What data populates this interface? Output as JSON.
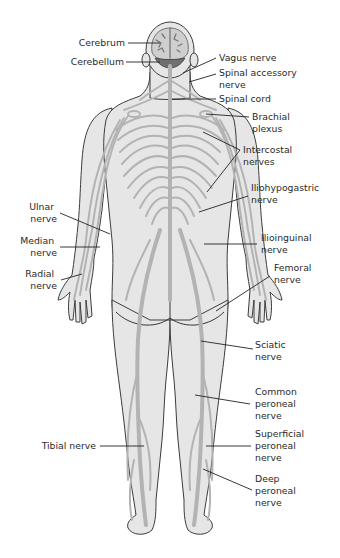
{
  "diagram": {
    "colors": {
      "body_fill": "#e6e6e6",
      "nerve": "#b3b3b3",
      "outline": "#3c3c3c",
      "label_text": "#2a2a2a"
    },
    "labels": {
      "cerebrum": [
        "Cerebrum"
      ],
      "cerebellum": [
        "Cerebellum"
      ],
      "vagus": [
        "Vagus nerve"
      ],
      "spinal_accessory": [
        "Spinal accessory",
        "nerve"
      ],
      "spinal_cord": [
        "Spinal cord"
      ],
      "brachial_plexus": [
        "Brachial",
        "plexus"
      ],
      "intercostal": [
        "Intercostal",
        "nerves"
      ],
      "iliohypogastric": [
        "Iliohypogastric",
        "nerve"
      ],
      "ilioinguinal": [
        "Ilioinguinal",
        "nerve"
      ],
      "femoral": [
        "Femoral",
        "nerve"
      ],
      "sciatic": [
        "Sciatic",
        "nerve"
      ],
      "common_peroneal": [
        "Common",
        "peroneal",
        "nerve"
      ],
      "superficial_peroneal": [
        "Superficial",
        "peroneal",
        "nerve"
      ],
      "deep_peroneal": [
        "Deep",
        "peroneal",
        "nerve"
      ],
      "tibial": [
        "Tibial nerve"
      ],
      "ulnar": [
        "Ulnar",
        "nerve"
      ],
      "median": [
        "Median",
        "nerve"
      ],
      "radial": [
        "Radial",
        "nerve"
      ]
    }
  }
}
